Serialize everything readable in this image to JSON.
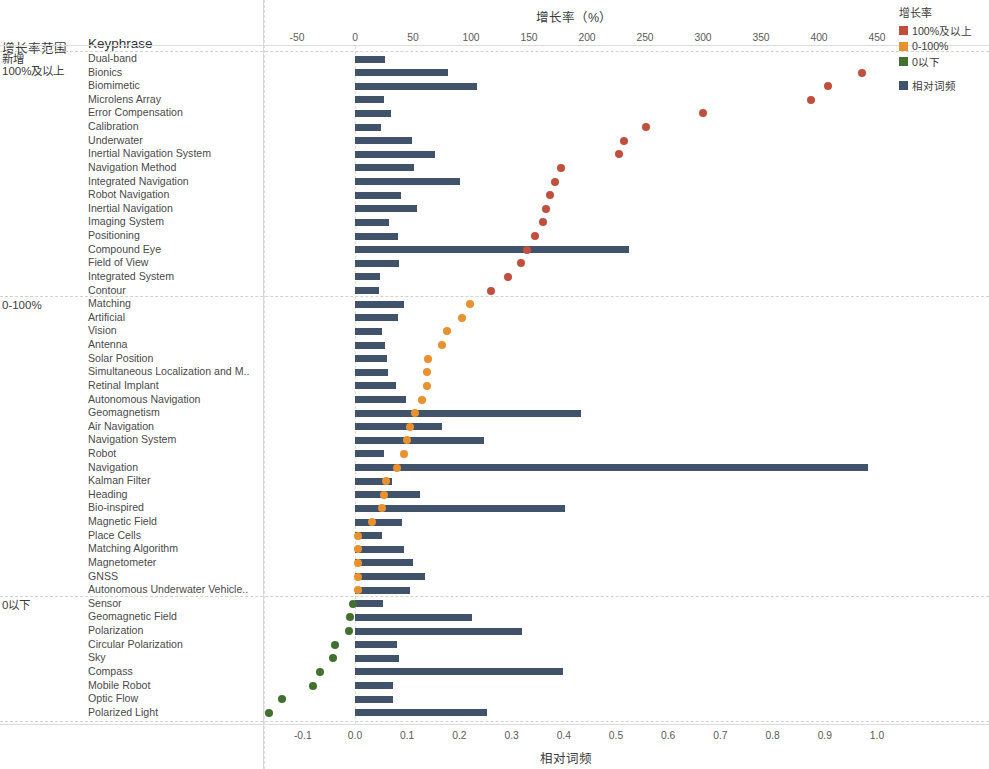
{
  "header": {
    "range_column_label": "增长率范围",
    "keyphrase_column_label": "Keyphrase"
  },
  "top_axis": {
    "title": "增长率（%）",
    "ticks": [
      "-50",
      "0",
      "50",
      "100",
      "150",
      "200",
      "250",
      "300",
      "350",
      "400",
      "450"
    ],
    "tick_values": [
      -50,
      0,
      50,
      100,
      150,
      200,
      250,
      300,
      350,
      400,
      450
    ]
  },
  "bottom_axis": {
    "title": "相对词频",
    "ticks": [
      "-0.1",
      "0.0",
      "0.1",
      "0.2",
      "0.3",
      "0.4",
      "0.5",
      "0.6",
      "0.7",
      "0.8",
      "0.9",
      "1.0"
    ],
    "tick_values": [
      -0.1,
      0.0,
      0.1,
      0.2,
      0.3,
      0.4,
      0.5,
      0.6,
      0.7,
      0.8,
      0.9,
      1.0
    ]
  },
  "legend": {
    "title": "增长率",
    "items": [
      {
        "label": "100%及以上",
        "color": "#c0503d"
      },
      {
        "label": "0-100%",
        "color": "#e8912e"
      },
      {
        "label": "0以下",
        "color": "#41702f"
      }
    ],
    "bar_item": {
      "label": "相对词频",
      "color": "#41536b"
    }
  },
  "groups": [
    {
      "label": "新增",
      "sublabel": "100%及以上",
      "category": 0
    },
    {
      "label": "0-100%",
      "sublabel": "",
      "category": 1
    },
    {
      "label": "0以下",
      "sublabel": "",
      "category": 2
    }
  ],
  "chart_data": {
    "type": "bar",
    "title": "增长率（%）",
    "xlabel": "相对词频",
    "ylabel": "Keyphrase",
    "x_top_label": "增长率（%）",
    "x_top_lim": [
      -75,
      470
    ],
    "x_bottom_lim": [
      -0.145,
      1.04
    ],
    "grid": true,
    "legend_position": "top-right",
    "series": [
      {
        "name": "相对词频",
        "type": "bar",
        "color": "#41536b",
        "axis": "bottom"
      },
      {
        "name": "增长率",
        "type": "scatter",
        "axis": "top"
      }
    ],
    "categories": [
      "Dual-band",
      "Bionics",
      "Biomimetic",
      "Microlens Array",
      "Error Compensation",
      "Calibration",
      "Underwater",
      "Inertial Navigation System",
      "Navigation Method",
      "Integrated Navigation",
      "Robot Navigation",
      "Inertial Navigation",
      "Imaging System",
      "Positioning",
      "Compound Eye",
      "Field of View",
      "Integrated System",
      "Contour",
      "Matching",
      "Artificial",
      "Vision",
      "Antenna",
      "Solar Position",
      "Simultaneous Localization and M..",
      "Retinal Implant",
      "Autonomous Navigation",
      "Geomagnetism",
      "Air Navigation",
      "Navigation System",
      "Robot",
      "Navigation",
      "Kalman Filter",
      "Heading",
      "Bio-inspired",
      "Magnetic Field",
      "Place Cells",
      "Matching Algorithm",
      "Magnetometer",
      "GNSS",
      "Autonomous Underwater Vehicle..",
      "Sensor",
      "Geomagnetic Field",
      "Polarization",
      "Circular Polarization",
      "Sky",
      "Compass",
      "Mobile Robot",
      "Optic Flow",
      "Polarized Light"
    ],
    "rows": [
      {
        "keyphrase": "Dual-band",
        "group": 0,
        "rel_freq": 0.057,
        "growth": null
      },
      {
        "keyphrase": "Bionics",
        "group": 0,
        "rel_freq": 0.178,
        "growth": 437
      },
      {
        "keyphrase": "Biomimetic",
        "group": 0,
        "rel_freq": 0.233,
        "growth": 408
      },
      {
        "keyphrase": "Microlens Array",
        "group": 0,
        "rel_freq": 0.055,
        "growth": 393
      },
      {
        "keyphrase": "Error Compensation",
        "group": 0,
        "rel_freq": 0.069,
        "growth": 300
      },
      {
        "keyphrase": "Calibration",
        "group": 0,
        "rel_freq": 0.05,
        "growth": 251
      },
      {
        "keyphrase": "Underwater",
        "group": 0,
        "rel_freq": 0.11,
        "growth": 232
      },
      {
        "keyphrase": "Inertial Navigation System",
        "group": 0,
        "rel_freq": 0.153,
        "growth": 228
      },
      {
        "keyphrase": "Navigation Method",
        "group": 0,
        "rel_freq": 0.113,
        "growth": 178
      },
      {
        "keyphrase": "Integrated Navigation",
        "group": 0,
        "rel_freq": 0.202,
        "growth": 172
      },
      {
        "keyphrase": "Robot Navigation",
        "group": 0,
        "rel_freq": 0.088,
        "growth": 168
      },
      {
        "keyphrase": "Inertial Navigation",
        "group": 0,
        "rel_freq": 0.118,
        "growth": 165
      },
      {
        "keyphrase": "Imaging System",
        "group": 0,
        "rel_freq": 0.066,
        "growth": 162
      },
      {
        "keyphrase": "Positioning",
        "group": 0,
        "rel_freq": 0.082,
        "growth": 155
      },
      {
        "keyphrase": "Compound Eye",
        "group": 0,
        "rel_freq": 0.524,
        "growth": 148
      },
      {
        "keyphrase": "Field of View",
        "group": 0,
        "rel_freq": 0.085,
        "growth": 143
      },
      {
        "keyphrase": "Integrated System",
        "group": 0,
        "rel_freq": 0.047,
        "growth": 132
      },
      {
        "keyphrase": "Contour",
        "group": 0,
        "rel_freq": 0.046,
        "growth": 117
      },
      {
        "keyphrase": "Matching",
        "group": 1,
        "rel_freq": 0.093,
        "growth": 99
      },
      {
        "keyphrase": "Artificial",
        "group": 1,
        "rel_freq": 0.082,
        "growth": 92
      },
      {
        "keyphrase": "Vision",
        "group": 1,
        "rel_freq": 0.052,
        "growth": 79
      },
      {
        "keyphrase": "Antenna",
        "group": 1,
        "rel_freq": 0.057,
        "growth": 75
      },
      {
        "keyphrase": "Solar Position",
        "group": 1,
        "rel_freq": 0.062,
        "growth": 63
      },
      {
        "keyphrase": "Simultaneous Localization and M..",
        "group": 1,
        "rel_freq": 0.063,
        "growth": 62
      },
      {
        "keyphrase": "Retinal Implant",
        "group": 1,
        "rel_freq": 0.078,
        "growth": 62
      },
      {
        "keyphrase": "Autonomous Navigation",
        "group": 1,
        "rel_freq": 0.098,
        "growth": 58
      },
      {
        "keyphrase": "Geomagnetism",
        "group": 1,
        "rel_freq": 0.432,
        "growth": 52
      },
      {
        "keyphrase": "Air Navigation",
        "group": 1,
        "rel_freq": 0.167,
        "growth": 47
      },
      {
        "keyphrase": "Navigation System",
        "group": 1,
        "rel_freq": 0.247,
        "growth": 45
      },
      {
        "keyphrase": "Robot",
        "group": 1,
        "rel_freq": 0.056,
        "growth": 42
      },
      {
        "keyphrase": "Navigation",
        "group": 1,
        "rel_freq": 0.982,
        "growth": 36
      },
      {
        "keyphrase": "Kalman Filter",
        "group": 1,
        "rel_freq": 0.07,
        "growth": 27
      },
      {
        "keyphrase": "Heading",
        "group": 1,
        "rel_freq": 0.124,
        "growth": 25
      },
      {
        "keyphrase": "Bio-inspired",
        "group": 1,
        "rel_freq": 0.403,
        "growth": 23
      },
      {
        "keyphrase": "Magnetic Field",
        "group": 1,
        "rel_freq": 0.09,
        "growth": 15
      },
      {
        "keyphrase": "Place Cells",
        "group": 1,
        "rel_freq": 0.052,
        "growth": 3
      },
      {
        "keyphrase": "Matching Algorithm",
        "group": 1,
        "rel_freq": 0.094,
        "growth": 3
      },
      {
        "keyphrase": "Magnetometer",
        "group": 1,
        "rel_freq": 0.112,
        "growth": 3
      },
      {
        "keyphrase": "GNSS",
        "group": 1,
        "rel_freq": 0.135,
        "growth": 3
      },
      {
        "keyphrase": "Autonomous Underwater Vehicle..",
        "group": 1,
        "rel_freq": 0.105,
        "growth": 3
      },
      {
        "keyphrase": "Sensor",
        "group": 2,
        "rel_freq": 0.053,
        "growth": -2
      },
      {
        "keyphrase": "Geomagnetic Field",
        "group": 2,
        "rel_freq": 0.225,
        "growth": -4
      },
      {
        "keyphrase": "Polarization",
        "group": 2,
        "rel_freq": 0.32,
        "growth": -5
      },
      {
        "keyphrase": "Circular Polarization",
        "group": 2,
        "rel_freq": 0.08,
        "growth": -17
      },
      {
        "keyphrase": "Sky",
        "group": 2,
        "rel_freq": 0.085,
        "growth": -19
      },
      {
        "keyphrase": "Compass",
        "group": 2,
        "rel_freq": 0.398,
        "growth": -30
      },
      {
        "keyphrase": "Mobile Robot",
        "group": 2,
        "rel_freq": 0.073,
        "growth": -36
      },
      {
        "keyphrase": "Optic Flow",
        "group": 2,
        "rel_freq": 0.072,
        "growth": -63
      },
      {
        "keyphrase": "Polarized Light",
        "group": 2,
        "rel_freq": 0.252,
        "growth": -74
      }
    ]
  }
}
